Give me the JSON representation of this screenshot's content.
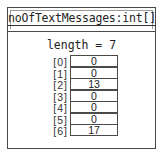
{
  "object": {
    "title": "noOfTextMessages:int[]",
    "length_label": "length = 7"
  },
  "array": {
    "items": [
      {
        "index": "[0]",
        "value": "0"
      },
      {
        "index": "[1]",
        "value": "0"
      },
      {
        "index": "[2]",
        "value": "13"
      },
      {
        "index": "[3]",
        "value": "0"
      },
      {
        "index": "[4]",
        "value": "0"
      },
      {
        "index": "[5]",
        "value": "0"
      },
      {
        "index": "[6]",
        "value": "17"
      }
    ]
  }
}
